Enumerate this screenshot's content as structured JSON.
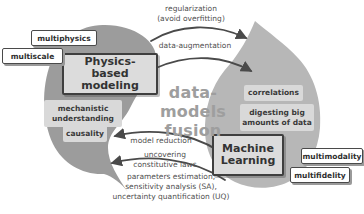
{
  "colors": {
    "physics_blob": "#9c9c9c",
    "ml_blob": "#b7b7b7",
    "inner_box_fill": "#d9d9d9",
    "outer_box_fill": "#ffffff",
    "box_border": "#3f3f3f",
    "arrow": "#4a4a4a",
    "center_text": "#9e9e9e",
    "label_text": "#3a3a3a"
  },
  "center": {
    "line1": "data-models",
    "line2": "fusion"
  },
  "physics": {
    "title": "Physics-based modeling",
    "inner_labels": [
      "mechanistic understanding",
      "causality"
    ],
    "outer_labels": [
      "multiphysics",
      "multiscale"
    ]
  },
  "ml": {
    "title": "Machine Learning",
    "inner_labels": [
      "correlations",
      "digesting big amounts of data"
    ],
    "outer_labels": [
      "multimodality",
      "multifidelity"
    ]
  },
  "flows": {
    "to_ml": {
      "arrow1": {
        "line1": "regularization",
        "line2": "(avoid overfitting)"
      },
      "arrow2": {
        "line1": "data-augmentation"
      }
    },
    "to_physics": {
      "arrow1": {
        "line1": "model reduction"
      },
      "arrow2": {
        "line1": "uncovering",
        "line2": "constitutive laws"
      },
      "arrow3": {
        "line1": "parameters estimation,",
        "line2": "sensitivity analysis (SA),",
        "line3": "uncertainty quantification (UQ)"
      }
    }
  }
}
